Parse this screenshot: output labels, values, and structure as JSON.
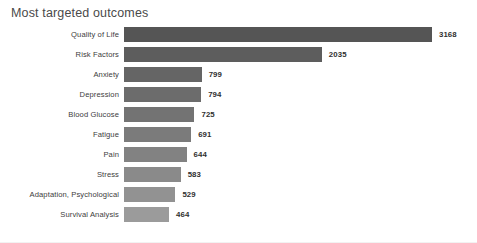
{
  "chart_data": {
    "type": "bar",
    "orientation": "horizontal",
    "title": "Most targeted outcomes",
    "xlabel": "",
    "ylabel": "",
    "grid": false,
    "legend": false,
    "xlim": [
      0,
      3168
    ],
    "categories": [
      "Quality of Life",
      "Risk Factors",
      "Anxiety",
      "Depression",
      "Blood Glucose",
      "Fatigue",
      "Pain",
      "Stress",
      "Adaptation, Psychological",
      "Survival Analysis"
    ],
    "values": [
      3168,
      2035,
      799,
      794,
      725,
      691,
      644,
      583,
      529,
      464
    ],
    "value_labels": [
      "3168",
      "2035",
      "799",
      "794",
      "725",
      "691",
      "644",
      "583",
      "529",
      "464"
    ],
    "bar_colors": [
      "#555555",
      "#5d5d5d",
      "#656565",
      "#6c6c6c",
      "#737373",
      "#7b7b7b",
      "#828282",
      "#8a8a8a",
      "#929292",
      "#9b9b9b"
    ],
    "background_color": "#ffffff",
    "label_color": "#3d3d3d",
    "value_color": "#2f2f2f",
    "title_color": "#4a4a4a"
  }
}
